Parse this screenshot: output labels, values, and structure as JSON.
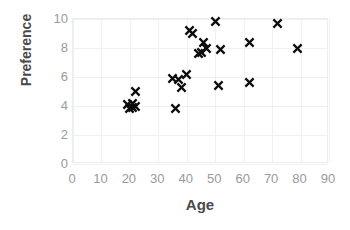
{
  "chart_data": {
    "type": "scatter",
    "title": "",
    "xlabel": "Age",
    "ylabel": "Preference",
    "xlim": [
      0,
      90
    ],
    "ylim": [
      0,
      10
    ],
    "xticks": [
      0,
      10,
      20,
      30,
      40,
      50,
      60,
      70,
      80,
      90
    ],
    "yticks": [
      0,
      2,
      4,
      6,
      8,
      10
    ],
    "grid": true,
    "legend": null,
    "marker": "x",
    "marker_color": "#0d0d0d",
    "series": [
      {
        "name": "observations",
        "points": [
          [
            19,
            4.1
          ],
          [
            20,
            3.8
          ],
          [
            21,
            4.2
          ],
          [
            21,
            3.9
          ],
          [
            22,
            4.0
          ],
          [
            22,
            5.0
          ],
          [
            35,
            5.9
          ],
          [
            36,
            3.8
          ],
          [
            37,
            5.8
          ],
          [
            38,
            5.3
          ],
          [
            40,
            6.2
          ],
          [
            41,
            9.2
          ],
          [
            42,
            9.0
          ],
          [
            44,
            7.6
          ],
          [
            45,
            7.7
          ],
          [
            46,
            8.4
          ],
          [
            47,
            8.0
          ],
          [
            50,
            9.8
          ],
          [
            51,
            5.4
          ],
          [
            52,
            7.9
          ],
          [
            62,
            5.6
          ],
          [
            62,
            8.4
          ],
          [
            72,
            9.7
          ],
          [
            79,
            8.0
          ]
        ]
      }
    ]
  },
  "axes": {
    "x_title": "Age",
    "y_title": "Preference"
  }
}
